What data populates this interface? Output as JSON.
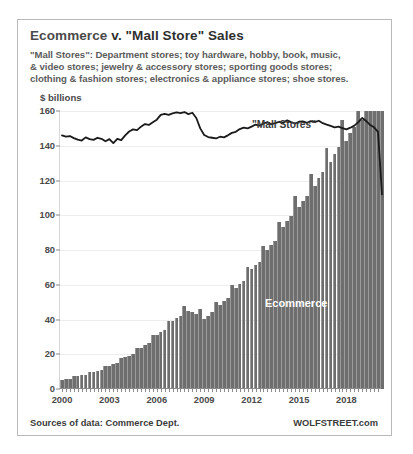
{
  "card": {
    "title_prefix": "Ecommerce",
    "title_rest": " v. \"Mall Store\" Sales",
    "subtitle_lines": [
      "\"Mall Stores\": Department stores; toy hardware, hobby, book, music,",
      "& video stores; jewelry & accessory stores; sporting goods stores;",
      "clothing & fashion stores; electronics & appliance stores; shoe stores."
    ],
    "source_left": "Sources of data: Commerce Dept.",
    "source_right": "WOLFSTREET.com"
  },
  "chart_data": {
    "type": "bar",
    "title": "Ecommerce v. \"Mall Store\" Sales",
    "subtitle": "\"Mall Stores\": Department stores; toy hardware, hobby, book, music, & video stores; jewelry & accessory stores; sporting goods stores; clothing & fashion stores; electronics & appliance stores; shoe stores.",
    "xlabel": "",
    "ylabel": "$ billions",
    "ylim": [
      0,
      160
    ],
    "yticks": [
      0,
      20,
      40,
      60,
      80,
      100,
      120,
      140,
      160
    ],
    "xticks": [
      "2000",
      "2003",
      "2006",
      "2009",
      "2012",
      "2015",
      "2018"
    ],
    "xtick_quarters": [
      0,
      12,
      24,
      36,
      48,
      60,
      72
    ],
    "xlim_quarters": [
      0,
      81
    ],
    "grid": true,
    "legend_position": "inline-annotations",
    "annotations": [
      {
        "text": "\"Mall Stores\"",
        "series": "Mall Stores",
        "color": "#3a3a3a"
      },
      {
        "text": "Ecommerce",
        "series": "Ecommerce",
        "color": "#ffffff"
      }
    ],
    "colors": {
      "bar": "#6e6e6e",
      "line": "#1a1a1a",
      "grid": "#ededed",
      "axis": "#8a8a8a"
    },
    "x_start_year": 2000,
    "x_period": "quarterly",
    "series": [
      {
        "name": "Ecommerce",
        "render": "bar",
        "color": "#6e6e6e",
        "values": [
          5.1,
          5.6,
          6.0,
          7.4,
          7.6,
          7.8,
          8.0,
          9.6,
          9.7,
          10.3,
          11.0,
          13.1,
          13.4,
          14.2,
          15.1,
          18.0,
          18.2,
          19.1,
          20.1,
          23.6,
          23.8,
          25.1,
          26.4,
          30.9,
          31.3,
          32.6,
          34.1,
          39.2,
          39.4,
          41.0,
          42.3,
          47.5,
          44.8,
          44.2,
          43.2,
          46.0,
          40.5,
          42.3,
          44.2,
          50.3,
          48.6,
          50.5,
          52.3,
          59.6,
          58.0,
          60.3,
          61.9,
          70.0,
          68.8,
          71.2,
          73.1,
          82.2,
          80.0,
          83.0,
          85.4,
          96.1,
          93.0,
          96.5,
          99.4,
          111.0,
          104.5,
          108.3,
          111.2,
          124.0,
          117.0,
          121.3,
          124.7,
          139.0,
          130.5,
          135.2,
          139.4,
          155.0,
          143.0,
          147.6,
          151.0,
          167.0,
          155.0,
          160.0,
          163.0,
          178.0,
          170.0,
          196.0
        ],
        "note": "quarterly retail ecommerce sales, $ billions, 2000Q1 onward (visible bar heights capped by 160 axis)"
      },
      {
        "name": "Mall Stores",
        "render": "line",
        "color": "#1a1a1a",
        "values": [
          146.0,
          145.2,
          145.6,
          144.4,
          143.5,
          143.0,
          144.8,
          143.8,
          143.4,
          144.6,
          144.0,
          142.6,
          143.8,
          141.5,
          144.0,
          143.2,
          146.0,
          148.2,
          149.4,
          149.0,
          151.0,
          152.5,
          152.0,
          153.5,
          155.0,
          157.8,
          158.4,
          157.8,
          158.6,
          159.2,
          158.8,
          159.4,
          158.2,
          159.0,
          156.0,
          150.0,
          146.2,
          145.0,
          144.6,
          144.2,
          145.2,
          144.8,
          146.0,
          147.4,
          148.0,
          149.6,
          150.4,
          150.0,
          151.0,
          152.2,
          151.6,
          152.8,
          153.6,
          152.4,
          153.0,
          153.8,
          153.2,
          154.6,
          153.6,
          152.8,
          153.8,
          154.0,
          153.2,
          154.2,
          153.6,
          154.4,
          153.0,
          152.2,
          151.4,
          150.6,
          151.0,
          150.2,
          149.4,
          150.4,
          151.6,
          153.6,
          156.0,
          154.2,
          152.0,
          150.6,
          148.0,
          112.0
        ],
        "note": "quarterly brick-and-mortar 'mall store' sales, $ billions"
      }
    ]
  }
}
